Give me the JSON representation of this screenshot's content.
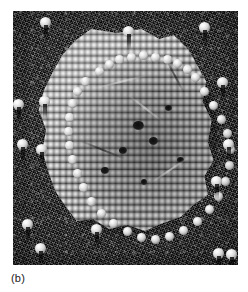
{
  "figure": {
    "panel_label": "(b)",
    "image_type": "electron-micrograph",
    "background_color": "#3b3b3b",
    "sphere_highlight_color": "#ffffff",
    "sphere_shadow_color": "#000000",
    "page_background": "#ffffff",
    "caption_color": "#1a1a1a",
    "plate": {
      "left": 13,
      "top": 11,
      "width": 225,
      "height": 254
    },
    "lattice": {
      "packing": "hexagonal close packed",
      "sphere_diameter_px": 6.2,
      "row_pitch_px": 7.1
    },
    "free_spheres": [
      {
        "name": "free-sphere-top-left",
        "x": 27,
        "y": 6
      },
      {
        "name": "free-sphere-top-center",
        "x": 110,
        "y": 15
      },
      {
        "name": "free-sphere-top-right",
        "x": 186,
        "y": 11
      },
      {
        "name": "free-sphere-right-upper",
        "x": 204,
        "y": 66
      },
      {
        "name": "free-sphere-left-edge",
        "x": 0,
        "y": 88
      },
      {
        "name": "free-sphere-left-upper",
        "x": 26,
        "y": 85
      },
      {
        "name": "free-sphere-left-mid",
        "x": 4,
        "y": 128
      },
      {
        "name": "free-sphere-left-lower",
        "x": 23,
        "y": 133
      },
      {
        "name": "free-sphere-right-mid",
        "x": 210,
        "y": 128
      },
      {
        "name": "free-sphere-right-lower",
        "x": 198,
        "y": 165
      },
      {
        "name": "free-sphere-bottom-left",
        "x": 9,
        "y": 208
      },
      {
        "name": "free-sphere-bottom-left2",
        "x": 22,
        "y": 232
      },
      {
        "name": "free-sphere-bottom-center",
        "x": 78,
        "y": 213
      },
      {
        "name": "free-sphere-bottom-right",
        "x": 200,
        "y": 237
      },
      {
        "name": "free-sphere-bottom-right2",
        "x": 213,
        "y": 238
      }
    ],
    "rim_spheres": [
      {
        "x": 58,
        "y": 38
      },
      {
        "x": 68,
        "y": 31
      },
      {
        "x": 78,
        "y": 26
      },
      {
        "x": 90,
        "y": 24
      },
      {
        "x": 102,
        "y": 22
      },
      {
        "x": 114,
        "y": 24
      },
      {
        "x": 126,
        "y": 26
      },
      {
        "x": 136,
        "y": 30
      },
      {
        "x": 146,
        "y": 36
      },
      {
        "x": 154,
        "y": 44
      },
      {
        "x": 44,
        "y": 48
      },
      {
        "x": 36,
        "y": 58
      },
      {
        "x": 31,
        "y": 70
      },
      {
        "x": 28,
        "y": 84
      },
      {
        "x": 27,
        "y": 98
      },
      {
        "x": 28,
        "y": 112
      },
      {
        "x": 31,
        "y": 126
      },
      {
        "x": 36,
        "y": 140
      },
      {
        "x": 42,
        "y": 154
      },
      {
        "x": 50,
        "y": 168
      },
      {
        "x": 60,
        "y": 180
      },
      {
        "x": 72,
        "y": 190
      },
      {
        "x": 86,
        "y": 198
      },
      {
        "x": 100,
        "y": 204
      },
      {
        "x": 114,
        "y": 206
      },
      {
        "x": 128,
        "y": 203
      },
      {
        "x": 142,
        "y": 197
      },
      {
        "x": 156,
        "y": 188
      },
      {
        "x": 168,
        "y": 176
      },
      {
        "x": 177,
        "y": 163
      },
      {
        "x": 184,
        "y": 148
      },
      {
        "x": 188,
        "y": 132
      },
      {
        "x": 189,
        "y": 116
      },
      {
        "x": 186,
        "y": 100
      },
      {
        "x": 180,
        "y": 86
      },
      {
        "x": 172,
        "y": 72
      },
      {
        "x": 163,
        "y": 58
      }
    ],
    "vacancies": [
      {
        "x": 96,
        "y": 92,
        "w": 11,
        "h": 9
      },
      {
        "x": 112,
        "y": 108,
        "w": 9,
        "h": 8
      },
      {
        "x": 82,
        "y": 118,
        "w": 8,
        "h": 7
      },
      {
        "x": 128,
        "y": 76,
        "w": 7,
        "h": 6
      },
      {
        "x": 64,
        "y": 138,
        "w": 8,
        "h": 7
      },
      {
        "x": 140,
        "y": 128,
        "w": 7,
        "h": 6
      },
      {
        "x": 104,
        "y": 150,
        "w": 6,
        "h": 6
      }
    ]
  }
}
